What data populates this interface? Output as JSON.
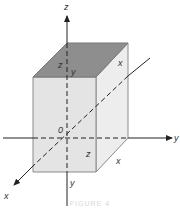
{
  "diagram": {
    "type": "3d-box-with-axes",
    "axes": [
      {
        "name": "z",
        "label": "z",
        "direction": "up"
      },
      {
        "name": "y",
        "label": "y",
        "direction": "right"
      },
      {
        "name": "x",
        "label": "x",
        "direction": "down-left"
      }
    ],
    "origin_label": "0",
    "box_labels": {
      "top_face_z": "z",
      "top_face_y": "y",
      "top_face_x": "x",
      "front_z": "z",
      "bottom_x": "x",
      "bottom_y": "y"
    },
    "colors": {
      "top_face": "#8c8c8c",
      "front_face": "#e6e6e6",
      "side_face": "#ededed",
      "edge": "#777777",
      "axis": "#333333"
    },
    "caption": "FIGURE 4"
  }
}
